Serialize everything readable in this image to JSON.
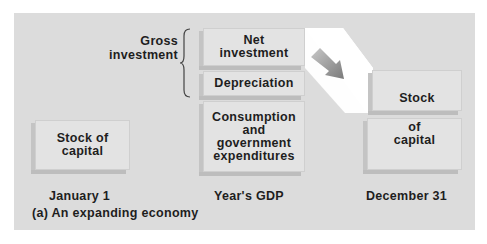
{
  "diagram": {
    "caption": "(a) An expanding economy",
    "left": {
      "box_label": "Stock of capital",
      "box_lines": [
        "Stock of",
        "capital"
      ],
      "column_label": "January 1"
    },
    "middle": {
      "column_label": "Year's GDP",
      "segments": [
        {
          "lines": [
            "Net",
            "investment"
          ]
        },
        {
          "lines": [
            "Depreciation"
          ]
        },
        {
          "lines": [
            "Consumption",
            "and",
            "government",
            "expenditures"
          ]
        }
      ],
      "brace_label_lines": [
        "Gross",
        "investment"
      ]
    },
    "right": {
      "top_box_lines": [
        "Stock"
      ],
      "bottom_box_lines": [
        "of",
        "capital"
      ],
      "column_label": "December 31"
    },
    "arrow": {
      "direction": "down-right",
      "from": "Net investment",
      "to": "Stock"
    },
    "colors": {
      "panel": "#dcdcdc",
      "box": "#e3e3e3",
      "box_shadow": "#c4c4c4",
      "band": "#ffffff",
      "arrow": "#8c8c8c",
      "text": "#1e1e1e"
    }
  }
}
